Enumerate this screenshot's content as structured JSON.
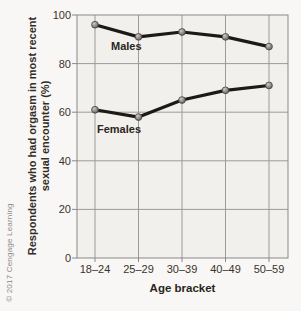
{
  "figure": {
    "copyright": "© 2017 Cengage Learning",
    "xlabel": "Age bracket",
    "ylabel_lines": [
      "Respondents who had orgasm in most recent",
      "sexual encounter (%)"
    ]
  },
  "chart_data": {
    "type": "line",
    "title": "",
    "categories": [
      "18–24",
      "25–29",
      "30–39",
      "40–49",
      "50–59"
    ],
    "series": [
      {
        "name": "Males",
        "values": [
          96,
          91,
          93,
          91,
          87
        ]
      },
      {
        "name": "Females",
        "values": [
          61,
          58,
          65,
          69,
          71
        ]
      }
    ],
    "xlabel": "Age bracket",
    "ylabel": "Respondents who had orgasm in most recent sexual encounter (%)",
    "ylim": [
      0,
      100
    ],
    "yticks": [
      0,
      20,
      40,
      60,
      80,
      100
    ],
    "grid": true,
    "legend": "inline-labels",
    "colors": {
      "page_bg": "#f8f7f5",
      "plot_bg": "#f1f0ed",
      "grid": "#9d9b99",
      "axis": "#8b8987",
      "line": "#1c1916",
      "marker_stroke": "#45423f",
      "tick_text": "#3a332c",
      "label_text": "#2b2520",
      "copyright_text": "#8d8a85"
    }
  }
}
